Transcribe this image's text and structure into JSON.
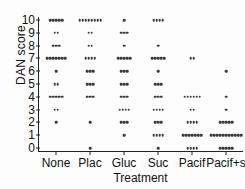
{
  "chart_data": {
    "type": "scatter",
    "title": "",
    "xlabel": "Treatment",
    "ylabel": "DAN score",
    "categories": [
      "None",
      "Plac",
      "Gluc",
      "Suc",
      "Pacif",
      "Pacif+s"
    ],
    "ytick_labels": [
      "0",
      "1",
      "2",
      "3",
      "4",
      "5",
      "6",
      "7",
      "8",
      "9",
      "10"
    ],
    "ylim": [
      0,
      10
    ],
    "grid": false,
    "legend": false,
    "note": "Dot-density strip plot: each row shows jittered points; counts per score level per treatment.",
    "counts": [
      {
        "category": "None",
        "by_score": {
          "0": 0,
          "1": 0,
          "2": 1,
          "3": 2,
          "4": 5,
          "5": 2,
          "6": 1,
          "7": 7,
          "8": 3,
          "9": 2,
          "10": 5
        }
      },
      {
        "category": "Plac",
        "by_score": {
          "0": 1,
          "1": 0,
          "2": 1,
          "3": 0,
          "4": 3,
          "5": 3,
          "6": 3,
          "7": 4,
          "8": 2,
          "9": 2,
          "10": 8
        }
      },
      {
        "category": "Gluc",
        "by_score": {
          "0": 0,
          "1": 1,
          "2": 3,
          "3": 4,
          "4": 3,
          "5": 3,
          "6": 3,
          "7": 5,
          "8": 1,
          "9": 3,
          "10": 1
        }
      },
      {
        "category": "Suc",
        "by_score": {
          "0": 1,
          "1": 4,
          "2": 3,
          "3": 4,
          "4": 3,
          "5": 3,
          "6": 1,
          "7": 5,
          "8": 1,
          "9": 0,
          "10": 4
        }
      },
      {
        "category": "Pacif",
        "by_score": {
          "0": 4,
          "1": 7,
          "2": 4,
          "3": 2,
          "4": 6,
          "5": 0,
          "6": 0,
          "7": 2,
          "8": 0,
          "9": 0,
          "10": 0
        }
      },
      {
        "category": "Pacif+s",
        "by_score": {
          "0": 5,
          "1": 11,
          "2": 5,
          "3": 1,
          "4": 1,
          "5": 0,
          "6": 1,
          "7": 0,
          "8": 0,
          "9": 0,
          "10": 0
        }
      }
    ],
    "dot_color": "#3a3a3a",
    "axis_color": "#222222"
  }
}
